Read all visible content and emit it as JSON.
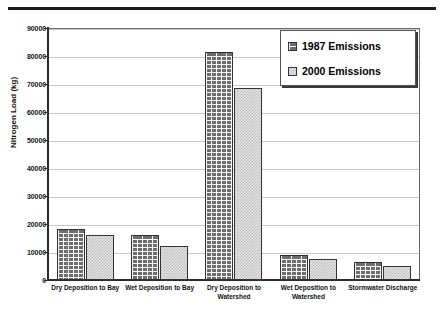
{
  "chart_data": {
    "type": "bar",
    "title": "",
    "subtitle": "",
    "xlabel": "",
    "ylabel": "Nitrogen Load (kg)",
    "ylim": [
      0,
      90000
    ],
    "ytick_labels": [
      "0",
      "10000",
      "20000",
      "30000",
      "40000",
      "50000",
      "60000",
      "70000",
      "80000",
      "90000"
    ],
    "ytick_values": [
      0,
      10000,
      20000,
      30000,
      40000,
      50000,
      60000,
      70000,
      80000,
      90000
    ],
    "grid": true,
    "grid_axis": "y",
    "legend_position": "upper right",
    "categories": [
      "Dry Deposition to Bay",
      "Wet Deposition to Bay",
      "Dry Deposition to Watershed",
      "Wet Deposition to Watershed",
      "Stormwater Discharge"
    ],
    "category_lines": [
      [
        "Dry Deposition to Bay"
      ],
      [
        "Wet Deposition to Bay"
      ],
      [
        "Dry Deposition to",
        "Watershed"
      ],
      [
        "Wet Deposition to",
        "Watershed"
      ],
      [
        "Stormwater Discharge"
      ]
    ],
    "series": [
      {
        "name": "1987 Emissions",
        "pattern": "brick-hatch",
        "color": "#6d6d6d",
        "values": [
          18200,
          16000,
          81500,
          8900,
          6400
        ]
      },
      {
        "name": "2000 Emissions",
        "pattern": "fine-speckle",
        "color": "#e3e3e3",
        "values": [
          16000,
          12200,
          68500,
          7400,
          5000
        ]
      }
    ]
  },
  "legend": {
    "items": [
      {
        "label": "1987 Emissions",
        "series": "s1987"
      },
      {
        "label": "2000 Emissions",
        "series": "s2000"
      }
    ]
  },
  "axes": {
    "y_title": "Nitrogen Load (kg)"
  },
  "colors": {
    "gridline": "#c9c9c9",
    "axis": "#2b2b2b",
    "frame": "#6a6a6a",
    "bar_1987": "#6d6d6d",
    "bar_2000": "#e3e3e3",
    "rule": "#1c1c1c"
  }
}
